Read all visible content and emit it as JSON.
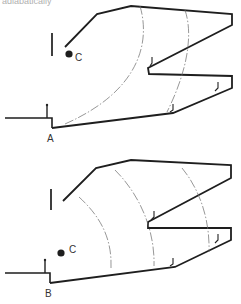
{
  "header": {
    "cutoff_text": "adiabatically"
  },
  "diagrams": [
    {
      "id": "top",
      "point_label": "A",
      "center_label": "C"
    },
    {
      "id": "bottom",
      "point_label": "B",
      "center_label": "C"
    }
  ],
  "colors": {
    "line": "#1e1e1e",
    "dashdot": "#6a6a6a",
    "background": "#ffffff"
  }
}
